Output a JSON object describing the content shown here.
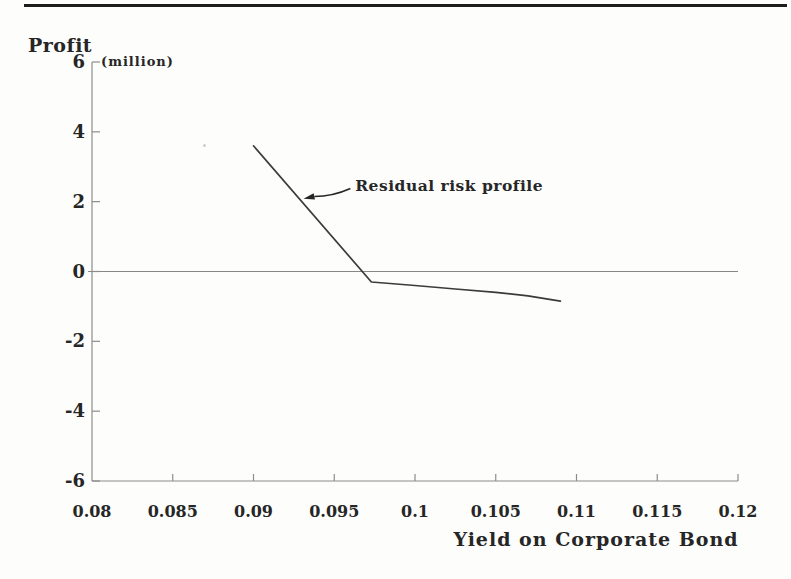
{
  "page": {
    "background": "#fdfdfb",
    "top_rule_color": "#1d1d1d"
  },
  "chart_data": {
    "type": "line",
    "title": "",
    "ylabel": "Profit",
    "ylabel_unit": "(million)",
    "xlabel": "Yield on Corporate Bond",
    "xlim": [
      0.08,
      0.12
    ],
    "ylim": [
      -6,
      6
    ],
    "grid": false,
    "legend": "none",
    "zero_line": true,
    "x_ticks": [
      0.08,
      0.085,
      0.09,
      0.095,
      0.1,
      0.105,
      0.11,
      0.115,
      0.12
    ],
    "x_tick_labels": [
      "0.08",
      "0.085",
      "0.09",
      "0.095",
      "0.1",
      "0.105",
      "0.11",
      "0.115",
      "0.12"
    ],
    "y_ticks": [
      6,
      4,
      2,
      0,
      -2,
      -4,
      -6
    ],
    "y_tick_labels": [
      "6",
      "4",
      "2",
      "0",
      "-2",
      "-4",
      "-6"
    ],
    "series": [
      {
        "name": "Residual risk profile",
        "points": [
          [
            0.09,
            3.6
          ],
          [
            0.0973,
            -0.3
          ],
          [
            0.1,
            -0.4
          ],
          [
            0.1025,
            -0.5
          ],
          [
            0.105,
            -0.6
          ],
          [
            0.107,
            -0.7
          ],
          [
            0.109,
            -0.85
          ]
        ]
      }
    ],
    "annotation": {
      "text": "Residual risk profile",
      "text_x": 0.0963,
      "text_y": 2.3,
      "arrow_from": [
        0.096,
        2.38
      ],
      "arrow_to": [
        0.0931,
        2.08
      ]
    },
    "colors": {
      "axis": "#8c8c8c",
      "zero_line": "#888888",
      "series_line": "#3b3b3b",
      "text": "#262626"
    }
  }
}
